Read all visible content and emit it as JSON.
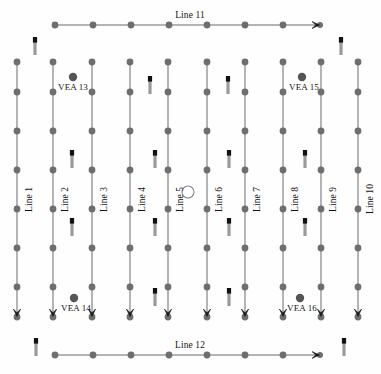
{
  "figure": {
    "colors": {
      "node_gray": "#6e6e6e",
      "line_gray": "#6b6b6b",
      "arrow_black": "#1a1a1a",
      "flag_cap": "#111111",
      "flag_stem": "#9a9a9a",
      "background": "#fefefe"
    }
  },
  "vertical_lines": [
    {
      "label": "Line 1",
      "x": 17,
      "label_y": 212,
      "dots_y": [
        62,
        92,
        131,
        170,
        209,
        248,
        287
      ],
      "end_y": 317
    },
    {
      "label": "Line 2",
      "x": 53,
      "label_y": 212,
      "dots_y": [
        62,
        92,
        131,
        170,
        209,
        248,
        287
      ],
      "end_y": 317
    },
    {
      "label": "Line 3",
      "x": 92,
      "label_y": 212,
      "dots_y": [
        62,
        92,
        131,
        170,
        209,
        248,
        287
      ],
      "end_y": 317
    },
    {
      "label": "Line 4",
      "x": 130,
      "label_y": 212,
      "dots_y": [
        62,
        92,
        131,
        170,
        209,
        248,
        287
      ],
      "end_y": 317
    },
    {
      "label": "Line 5",
      "x": 168,
      "label_y": 212,
      "dots_y": [
        62,
        92,
        131,
        170,
        209,
        248,
        287
      ],
      "end_y": 317
    },
    {
      "label": "Line 6",
      "x": 207,
      "label_y": 212,
      "dots_y": [
        62,
        92,
        131,
        170,
        209,
        248,
        287
      ],
      "end_y": 317
    },
    {
      "label": "Line 7",
      "x": 245,
      "label_y": 212,
      "dots_y": [
        62,
        92,
        131,
        170,
        209,
        248,
        287
      ],
      "end_y": 317
    },
    {
      "label": "Line 8",
      "x": 283,
      "label_y": 212,
      "dots_y": [
        62,
        92,
        131,
        170,
        209,
        248,
        287
      ],
      "end_y": 317
    },
    {
      "label": "Line 9",
      "x": 321,
      "label_y": 212,
      "dots_y": [
        62,
        92,
        131,
        170,
        209,
        248,
        287
      ],
      "end_y": 317
    },
    {
      "label": "Line 10",
      "x": 358,
      "label_y": 214,
      "dots_y": [
        62,
        92,
        131,
        170,
        209,
        248,
        287
      ],
      "end_y": 317
    }
  ],
  "horizontal_lines": [
    {
      "label": "Line 11",
      "y": 25,
      "label_x": 190,
      "label_y": 11,
      "dots_x": [
        55,
        93,
        131,
        169,
        207,
        245,
        283
      ],
      "end_x": 320
    },
    {
      "label": "Line 12",
      "y": 355,
      "label_x": 190,
      "label_y": 341,
      "dots_x": [
        55,
        93,
        131,
        169,
        207,
        245,
        283
      ],
      "end_x": 320
    }
  ],
  "vea_markers": [
    {
      "label": "VEA 13",
      "dot_x": 73,
      "dot_y": 77,
      "label_x": 73,
      "label_y": 83
    },
    {
      "label": "VEA 15",
      "dot_x": 302,
      "dot_y": 77,
      "label_x": 304,
      "label_y": 83
    },
    {
      "label": "VEA 14",
      "dot_x": 74,
      "dot_y": 298,
      "label_x": 76,
      "label_y": 304
    },
    {
      "label": "VEA 16",
      "dot_x": 300,
      "dot_y": 298,
      "label_x": 302,
      "label_y": 304
    }
  ],
  "center_circle": {
    "cx": 188,
    "cy": 192,
    "r": 6
  },
  "flag_markers": [
    {
      "x": 35,
      "y": 37
    },
    {
      "x": 341,
      "y": 37
    },
    {
      "x": 150,
      "y": 76
    },
    {
      "x": 228,
      "y": 76
    },
    {
      "x": 72,
      "y": 150
    },
    {
      "x": 155,
      "y": 150
    },
    {
      "x": 229,
      "y": 150
    },
    {
      "x": 305,
      "y": 150
    },
    {
      "x": 72,
      "y": 218
    },
    {
      "x": 155,
      "y": 218
    },
    {
      "x": 229,
      "y": 218
    },
    {
      "x": 305,
      "y": 218
    },
    {
      "x": 155,
      "y": 288
    },
    {
      "x": 229,
      "y": 288
    },
    {
      "x": 36,
      "y": 338
    },
    {
      "x": 344,
      "y": 338
    }
  ]
}
